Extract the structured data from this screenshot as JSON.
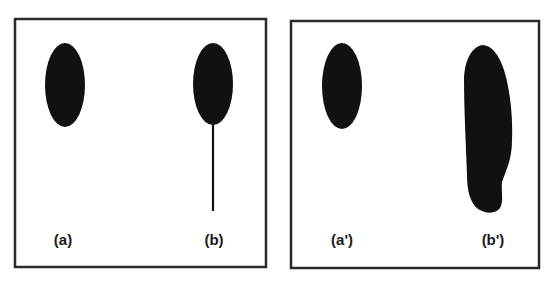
{
  "figure": {
    "colors": {
      "ink": "#111111",
      "frame": "#2a2a2a",
      "background": "#ffffff"
    },
    "panels": [
      {
        "id": "left",
        "items": [
          {
            "label": "(a)",
            "shape": "ellipse"
          },
          {
            "label": "(b)",
            "shape": "ellipse-with-tail"
          }
        ]
      },
      {
        "id": "right",
        "items": [
          {
            "label": "(a')",
            "shape": "ellipse"
          },
          {
            "label": "(b')",
            "shape": "elongated-blob"
          }
        ]
      }
    ]
  }
}
